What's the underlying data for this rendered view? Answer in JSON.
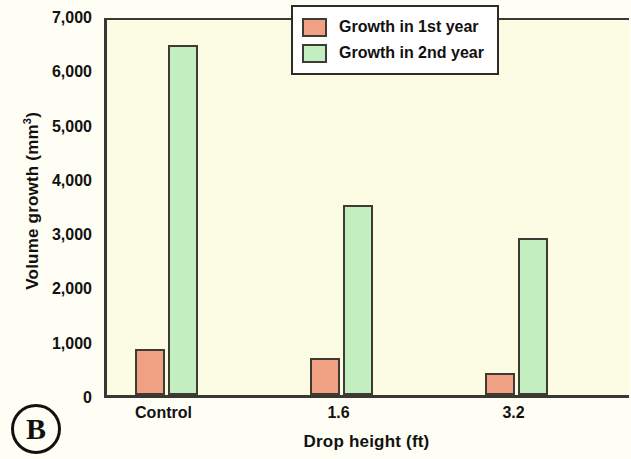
{
  "panel": {
    "label": "B"
  },
  "chart_data": {
    "type": "bar",
    "title": "",
    "subtitle": "",
    "xlabel": "Drop height (ft)",
    "ylabel": "Volume growth (mm",
    "ylabel_superscript": "3",
    "ylabel_suffix": ")",
    "categories": [
      "Control",
      "1.6",
      "3.2"
    ],
    "series": [
      {
        "name": "Growth in 1st year",
        "color": "#f0a184",
        "values": [
          850,
          680,
          410
        ]
      },
      {
        "name": "Growth in 2nd year",
        "color": "#c2eec0",
        "values": [
          6450,
          3500,
          2900
        ]
      }
    ],
    "ylim": [
      0,
      7000
    ],
    "ytick_values": [
      0,
      1000,
      2000,
      3000,
      4000,
      5000,
      6000,
      7000
    ],
    "ytick_labels": [
      "0",
      "1,000",
      "2,000",
      "3,000",
      "4,000",
      "5,000",
      "6,000",
      "7,000"
    ],
    "grid": false,
    "legend_position": "top-right",
    "legend_entries": [
      "Growth in 1st year",
      "Growth in 2nd year"
    ],
    "plot_background": "#fcfbe3",
    "figure_background": "#fffef4",
    "axis_color": "#3a3832",
    "bar_edge_color": "#3d3b33"
  }
}
